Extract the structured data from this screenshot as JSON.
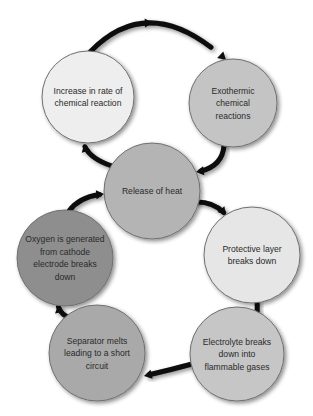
{
  "diagram": {
    "type": "cycle",
    "nodes": [
      {
        "id": "increase",
        "lines": [
          "Increase in rate of",
          "chemical reaction"
        ],
        "fill": "#eeeeee"
      },
      {
        "id": "exothermic",
        "lines": [
          "Exothermic",
          "chemical",
          "reactions"
        ],
        "fill": "#c4c4c4"
      },
      {
        "id": "release",
        "lines": [
          "Release of heat"
        ],
        "fill": "#b4b4b4"
      },
      {
        "id": "oxygen",
        "lines": [
          "Oxygen is generated",
          "from cathode",
          "electrode breaks",
          "down"
        ],
        "fill": "#8e8e8e"
      },
      {
        "id": "protective",
        "lines": [
          "Protective layer",
          "breaks down"
        ],
        "fill": "#e6e6e6"
      },
      {
        "id": "separator",
        "lines": [
          "Separator melts",
          "leading to a short",
          "circuit"
        ],
        "fill": "#a9a9a9"
      },
      {
        "id": "electrolyte",
        "lines": [
          "Electrolyte breaks",
          "down into",
          "flammable gases"
        ],
        "fill": "#c6c6c6"
      }
    ],
    "edges": [
      {
        "from": "increase",
        "to": "exothermic"
      },
      {
        "from": "exothermic",
        "to": "release"
      },
      {
        "from": "release",
        "to": "increase"
      },
      {
        "from": "release",
        "to": "protective"
      },
      {
        "from": "protective",
        "to": "electrolyte"
      },
      {
        "from": "electrolyte",
        "to": "separator"
      },
      {
        "from": "separator",
        "to": "oxygen"
      },
      {
        "from": "oxygen",
        "to": "release"
      }
    ],
    "arrow_color": "#0a0a0a",
    "text_color": "#2a2a2a"
  }
}
